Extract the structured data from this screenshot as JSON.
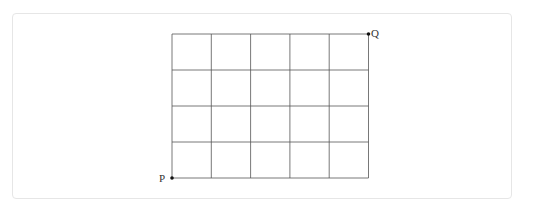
{
  "figure": {
    "type": "grid-path-diagram",
    "columns": 5,
    "rows": 4,
    "grid_origin": {
      "x": 172,
      "y": 34
    },
    "cell_width": 39.3,
    "cell_height": 36,
    "line_color": "#555555",
    "point_color": "#111111",
    "points": [
      {
        "label": "P",
        "position": "bottom-left",
        "grid_col": 0,
        "grid_row": 4
      },
      {
        "label": "Q",
        "position": "top-right",
        "grid_col": 5,
        "grid_row": 0
      }
    ]
  },
  "labels": {
    "p": "P",
    "q": "Q"
  }
}
